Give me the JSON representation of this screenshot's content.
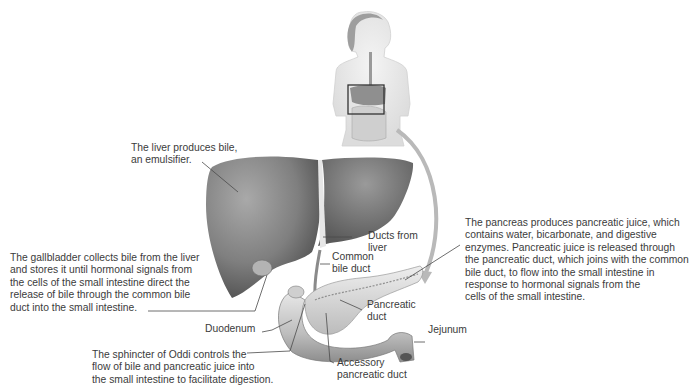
{
  "diagram": {
    "orientation_figure": {
      "label": "human-torso-figure",
      "highlight_box": "liver-pancreas-region"
    },
    "labels": {
      "liver": "The liver produces bile,\nan emulsifier.",
      "gallbladder": "The gallbladder collects bile from the liver\nand stores it until hormonal signals from\nthe cells of the small intestine direct the\nrelease of bile through the common bile\nduct into the small intestine.",
      "ducts_from_liver": "Ducts from\nliver",
      "common_bile_duct": "Common\nbile duct",
      "pancreas": "The pancreas produces pancreatic juice, which\ncontains water, bicarbonate, and digestive\nenzymes. Pancreatic juice is released through\nthe pancreatic duct, which joins with the common\nbile duct, to flow into the small intestine in\nresponse to hormonal signals from the\ncells of the small intestine.",
      "pancreatic_duct": "Pancreatic\nduct",
      "duodenum": "Duodenum",
      "jejunum": "Jejunum",
      "sphincter_of_oddi": "The sphincter of Oddi controls the\nflow of bile and pancreatic juice into\nthe small intestine to facilitate digestion.",
      "accessory_pancreatic_duct": "Accessory\npancreatic duct"
    },
    "colors": {
      "organ_fill": "#8a8a8a",
      "organ_dark": "#5e5e5e",
      "organ_light": "#c9c9c9",
      "leader_line": "#4a4a4a",
      "arrow": "#b9b9b9",
      "text": "#3b3b3b"
    }
  }
}
